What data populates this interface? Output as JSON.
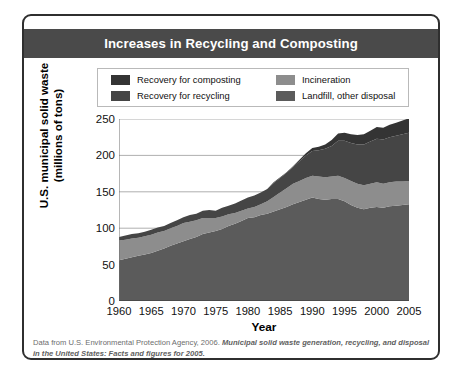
{
  "figure": {
    "title": "Increases in Recycling and Composting",
    "xlabel": "Year",
    "ylabel_line1": "U.S. municipal solid waste",
    "ylabel_line2": "(millions of tons)",
    "caption_plain": "Data from U.S. Environmental Protection Agency, 2006. ",
    "caption_italic": "Municipal solid waste generation, recycling, and disposal in the United States: Facts and figures for 2005."
  },
  "colors": {
    "title_bar": "#4a4a4a",
    "frame": "#2f2f2f",
    "composting": "#343434",
    "recycling": "#454545",
    "incineration": "#8d8d8d",
    "landfill": "#5b5b5b",
    "gridline": "#9a9a9a"
  },
  "chart_data": {
    "type": "area",
    "stacked": true,
    "title": "Increases in Recycling and Composting",
    "xlabel": "Year",
    "ylabel": "U.S. municipal solid waste (millions of tons)",
    "xlim": [
      1960,
      2005
    ],
    "ylim": [
      0,
      250
    ],
    "ytick_labels": [
      "0",
      "50",
      "100",
      "150",
      "200",
      "250"
    ],
    "yticks": [
      0,
      50,
      100,
      150,
      200,
      250
    ],
    "xtick_labels": [
      "1960",
      "1965",
      "1970",
      "1975",
      "1980",
      "1985",
      "1990",
      "1995",
      "2000",
      "2005"
    ],
    "xticks": [
      1960,
      1965,
      1970,
      1975,
      1980,
      1985,
      1990,
      1995,
      2000,
      2005
    ],
    "grid": "horizontal",
    "legend_position": "top-inside",
    "stack_order_bottom_to_top": [
      "Landfill, other disposal",
      "Incineration",
      "Recovery for recycling",
      "Recovery for composting"
    ],
    "x": [
      1960,
      1961,
      1962,
      1963,
      1964,
      1965,
      1966,
      1967,
      1968,
      1969,
      1970,
      1971,
      1972,
      1973,
      1974,
      1975,
      1976,
      1977,
      1978,
      1979,
      1980,
      1981,
      1982,
      1983,
      1984,
      1985,
      1986,
      1987,
      1988,
      1989,
      1990,
      1991,
      1992,
      1993,
      1994,
      1995,
      1996,
      1997,
      1998,
      1999,
      2000,
      2001,
      2002,
      2003,
      2004,
      2005
    ],
    "series": [
      {
        "name": "Landfill, other disposal",
        "color": "#5b5b5b",
        "values": [
          56,
          58,
          60,
          62,
          64,
          66,
          69,
          72,
          76,
          79,
          82,
          85,
          88,
          92,
          94,
          96,
          99,
          103,
          106,
          110,
          114,
          115,
          118,
          120,
          123,
          126,
          129,
          133,
          136,
          139,
          142,
          140,
          139,
          140,
          140,
          137,
          132,
          128,
          126,
          128,
          129,
          128,
          130,
          131,
          132,
          133
        ]
      },
      {
        "name": "Incineration",
        "color": "#8d8d8d",
        "values": [
          27,
          26,
          26,
          25,
          25,
          25,
          25,
          24,
          24,
          24,
          25,
          24,
          23,
          22,
          20,
          18,
          17,
          16,
          15,
          14,
          13,
          14,
          15,
          17,
          20,
          23,
          26,
          28,
          29,
          30,
          30,
          31,
          31,
          31,
          32,
          32,
          33,
          33,
          33,
          33,
          34,
          33,
          33,
          33,
          32,
          32
        ]
      },
      {
        "name": "Recovery for recycling",
        "color": "#454545",
        "values": [
          5,
          6,
          6,
          6,
          6,
          7,
          7,
          7,
          7,
          8,
          8,
          9,
          9,
          10,
          11,
          10,
          12,
          12,
          13,
          14,
          15,
          16,
          16,
          17,
          19,
          20,
          21,
          23,
          27,
          31,
          34,
          36,
          39,
          42,
          48,
          51,
          52,
          54,
          56,
          58,
          60,
          61,
          62,
          63,
          65,
          66
        ]
      },
      {
        "name": "Recovery for composting",
        "color": "#343434",
        "values": [
          0,
          0,
          0,
          0,
          0,
          0,
          0,
          0,
          0,
          0,
          0,
          0,
          0,
          0,
          0,
          0,
          0,
          0,
          0,
          0,
          0,
          0,
          0,
          0,
          1,
          1,
          1,
          1,
          2,
          3,
          4,
          5,
          6,
          8,
          10,
          11,
          12,
          13,
          14,
          15,
          16,
          16,
          17,
          18,
          19,
          20
        ]
      }
    ],
    "totals": [
      88,
      90,
      92,
      93,
      95,
      98,
      101,
      103,
      107,
      111,
      115,
      118,
      120,
      124,
      125,
      124,
      128,
      131,
      134,
      138,
      142,
      145,
      149,
      154,
      163,
      170,
      177,
      185,
      194,
      203,
      210,
      212,
      215,
      221,
      230,
      231,
      229,
      228,
      229,
      234,
      239,
      238,
      242,
      245,
      248,
      251
    ]
  },
  "legend": {
    "items": [
      {
        "label": "Recovery for composting",
        "color": "#343434"
      },
      {
        "label": "Recovery for recycling",
        "color": "#454545"
      },
      {
        "label": "Incineration",
        "color": "#8d8d8d"
      },
      {
        "label": "Landfill, other disposal",
        "color": "#5b5b5b"
      }
    ]
  }
}
